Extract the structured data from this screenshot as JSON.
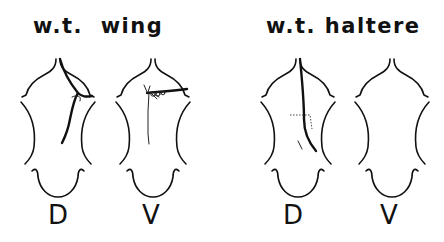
{
  "panels": [
    {
      "title": "w.t.  wing",
      "discs": [
        {
          "label": "D",
          "clone": "dorsal wing clone along margin"
        },
        {
          "label": "V",
          "clone": "ventral wing clone with bristles"
        }
      ]
    },
    {
      "title": "w.t. haltere",
      "discs": [
        {
          "label": "D",
          "clone": "dorsal haltere clone"
        },
        {
          "label": "V",
          "clone": "none"
        }
      ]
    }
  ],
  "colors": {
    "ink": "#111111",
    "background": "#ffffff"
  }
}
